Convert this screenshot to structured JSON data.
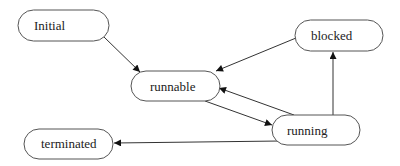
{
  "diagram": {
    "type": "state-diagram",
    "colors": {
      "stroke": "#555555",
      "arrow": "#111111",
      "text": "#222222",
      "background": "#ffffff"
    },
    "nodes": [
      {
        "id": "initial",
        "label": "Initial"
      },
      {
        "id": "runnable",
        "label": "runnable"
      },
      {
        "id": "blocked",
        "label": "blocked"
      },
      {
        "id": "running",
        "label": "running"
      },
      {
        "id": "terminated",
        "label": "terminated"
      }
    ],
    "edges": [
      {
        "from": "initial",
        "to": "runnable"
      },
      {
        "from": "blocked",
        "to": "runnable"
      },
      {
        "from": "runnable",
        "to": "running"
      },
      {
        "from": "running",
        "to": "runnable"
      },
      {
        "from": "running",
        "to": "blocked"
      },
      {
        "from": "running",
        "to": "terminated"
      }
    ]
  }
}
